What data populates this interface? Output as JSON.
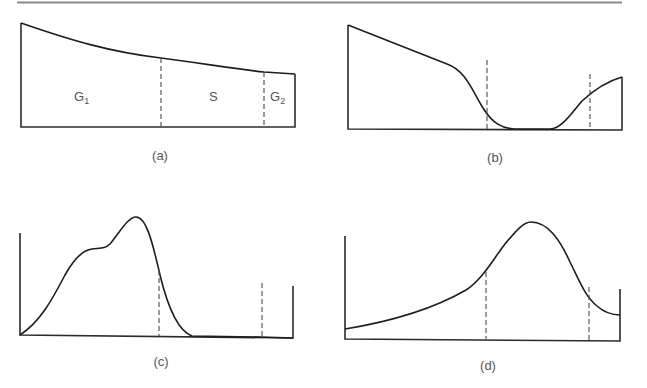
{
  "figure": {
    "rule_color": "#8a8a8a",
    "line_color": "#1e1e1e",
    "panels": [
      {
        "id": "a",
        "caption": "(a)",
        "regions": [
          {
            "label": "G",
            "subscript": "1"
          },
          {
            "label": "S",
            "subscript": ""
          },
          {
            "label": "G",
            "subscript": "2"
          }
        ],
        "description": "Monotonically decreasing curve over three regions separated by dashed lines"
      },
      {
        "id": "b",
        "caption": "(b)",
        "description": "High at left, steep drop near first dashed line, near-zero trough, rising after second dashed line"
      },
      {
        "id": "c",
        "caption": "(c)",
        "description": "Bimodal-shouldered peak left of first dashed line, falling to zero before second dashed line"
      },
      {
        "id": "d",
        "caption": "(d)",
        "description": "Skewed single peak between the two dashed lines, low tails on both sides"
      }
    ]
  }
}
